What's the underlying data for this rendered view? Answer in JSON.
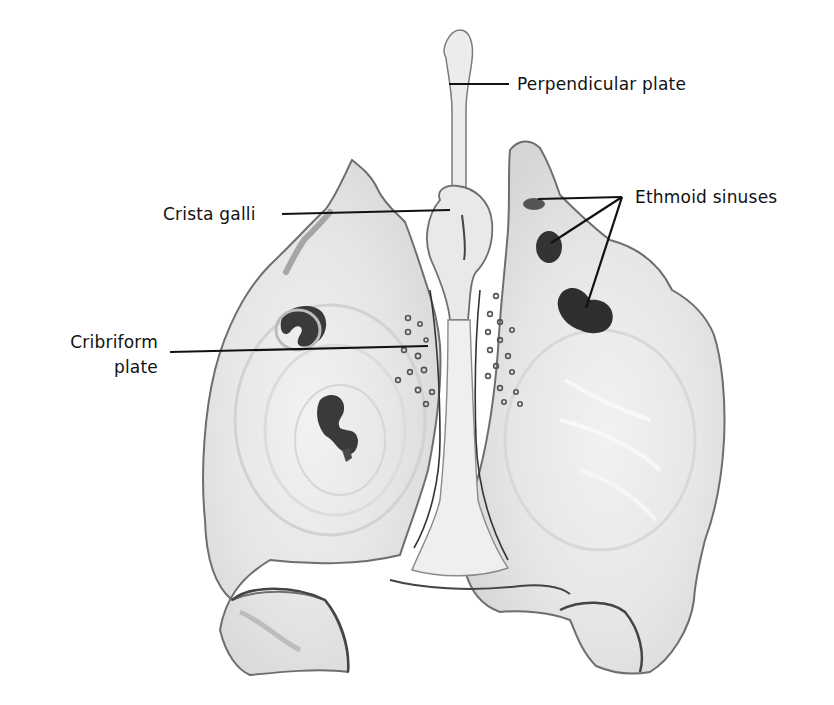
{
  "figure": {
    "colors": {
      "background": "#ffffff",
      "bone_fill": "#e4e4e4",
      "bone_light": "#f1f1f1",
      "bone_outline": "#6e6e6e",
      "cavity_dark": "#3a3a3a",
      "leader_line": "#111111",
      "label_text": "#111111"
    }
  },
  "labels": {
    "perpendicular_plate": "Perpendicular plate",
    "crista_galli": "Crista galli",
    "ethmoid_sinuses": "Ethmoid sinuses",
    "cribriform_plate_line1": "Cribriform",
    "cribriform_plate_line2": "plate"
  }
}
